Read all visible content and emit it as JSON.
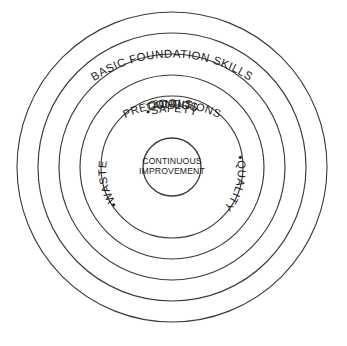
{
  "diagram": {
    "type": "concentric-circles",
    "background_color": "#ffffff",
    "stroke_color": "#3a3a3a",
    "text_color": "#1c1c1c",
    "center": {
      "x": 172,
      "y": 167
    },
    "rings": [
      {
        "index": 1,
        "label": "BASIC FOUNDATION SKILLS",
        "radius": 155,
        "label_radius": 140,
        "curved": true
      },
      {
        "index": 2,
        "label": "TOOLS",
        "radius": 134,
        "label_radius": 120,
        "curved": true
      },
      {
        "index": 3,
        "label": "PRECONDITIONS",
        "radius": 113,
        "label_radius": 99,
        "curved": true
      },
      {
        "index": 4,
        "label": "TACTICS",
        "radius": 92,
        "label_radius": 78,
        "curved": true
      },
      {
        "index": 5,
        "label": "SAFETY",
        "radius": 71,
        "label_radius": 56,
        "curved": true,
        "bullet": "•"
      },
      {
        "index": 6,
        "label": "CONTINUOUS IMPROVEMENT",
        "radius": 29,
        "curved": false
      }
    ],
    "core": {
      "line1": "CONTINUOUS",
      "line2": "IMPROVEMENT",
      "radius": 29
    },
    "satellite_labels": [
      {
        "name": "safety",
        "bullet": "•",
        "text": "SAFETY",
        "position": "top"
      },
      {
        "name": "waste",
        "bullet": "•",
        "text": "WASTE",
        "position": "bottom-left"
      },
      {
        "name": "quality",
        "bullet": "•",
        "text": "QUALITY",
        "position": "bottom-right"
      }
    ]
  }
}
